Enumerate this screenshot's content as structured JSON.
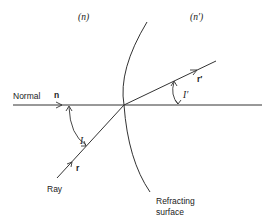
{
  "diagram": {
    "media": {
      "left": "(n)",
      "right": "(n′)"
    },
    "labels": {
      "normal": "Normal",
      "normal_vector": "n",
      "incident_angle": "I",
      "refracted_angle": "I′",
      "incident_vector": "r",
      "refracted_vector": "r′",
      "ray": "Ray",
      "surface_line1": "Refracting",
      "surface_line2": "surface"
    },
    "colors": {
      "line": "#333333",
      "background": "#ffffff"
    }
  }
}
